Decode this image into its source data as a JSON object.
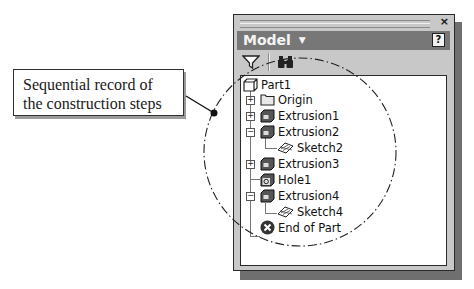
{
  "callout": {
    "line1": "Sequential record of",
    "line2": "the construction steps"
  },
  "panel": {
    "title": "Model",
    "title_dropdown_icon": "chevron-down-icon",
    "help_label": "?",
    "close_label": "×",
    "toolbar": {
      "filter_icon": "filter-icon",
      "find_icon": "binoculars-icon"
    }
  },
  "tree": {
    "items": [
      {
        "label": "Part1",
        "icon": "part-icon",
        "level": 0,
        "expander": ""
      },
      {
        "label": "Origin",
        "icon": "folder-icon",
        "level": 1,
        "expander": "+"
      },
      {
        "label": "Extrusion1",
        "icon": "extrusion-icon",
        "level": 1,
        "expander": "+"
      },
      {
        "label": "Extrusion2",
        "icon": "extrusion-icon",
        "level": 1,
        "expander": "−"
      },
      {
        "label": "Sketch2",
        "icon": "sketch-icon",
        "level": 2,
        "expander": ""
      },
      {
        "label": "Extrusion3",
        "icon": "extrusion-icon",
        "level": 1,
        "expander": "+"
      },
      {
        "label": "Hole1",
        "icon": "hole-icon",
        "level": 1,
        "expander": ""
      },
      {
        "label": "Extrusion4",
        "icon": "extrusion-icon",
        "level": 1,
        "expander": "−"
      },
      {
        "label": "Sketch4",
        "icon": "sketch-icon",
        "level": 2,
        "expander": ""
      },
      {
        "label": "End of Part",
        "icon": "end-of-part-icon",
        "level": 1,
        "expander": ""
      }
    ]
  },
  "colors": {
    "panel_bg": "#c8c8c8",
    "header_bg": "#777777",
    "header_text": "#f4f4f4",
    "shadow": "#6f6f6f"
  }
}
